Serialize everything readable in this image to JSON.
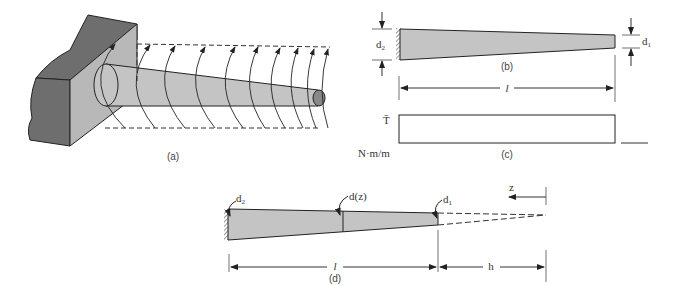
{
  "figure": {
    "panels": [
      {
        "id": "a",
        "caption": "(a)",
        "description": "Tapered circular shaft fixed to wall with distributed torque arcs"
      },
      {
        "id": "b",
        "caption": "(b)",
        "labels": {
          "left_diameter": "d",
          "left_sub": "2",
          "right_diameter": "d",
          "right_sub": "1",
          "length": "l"
        }
      },
      {
        "id": "c",
        "caption": "(c)",
        "labels": {
          "torque": "T̄",
          "units": "N·m/m"
        }
      },
      {
        "id": "d",
        "caption": "(d)",
        "labels": {
          "left_diameter": "d",
          "left_sub": "2",
          "mid_diameter": "d(z)",
          "right_diameter": "d",
          "right_sub": "1",
          "axis": "z",
          "length": "l",
          "extension": "h"
        }
      }
    ]
  },
  "colors": {
    "fill": "#c4c4c4",
    "wall_dark": "#6e6e6e",
    "wall_light": "#b8b8b8",
    "stroke": "#222222"
  }
}
